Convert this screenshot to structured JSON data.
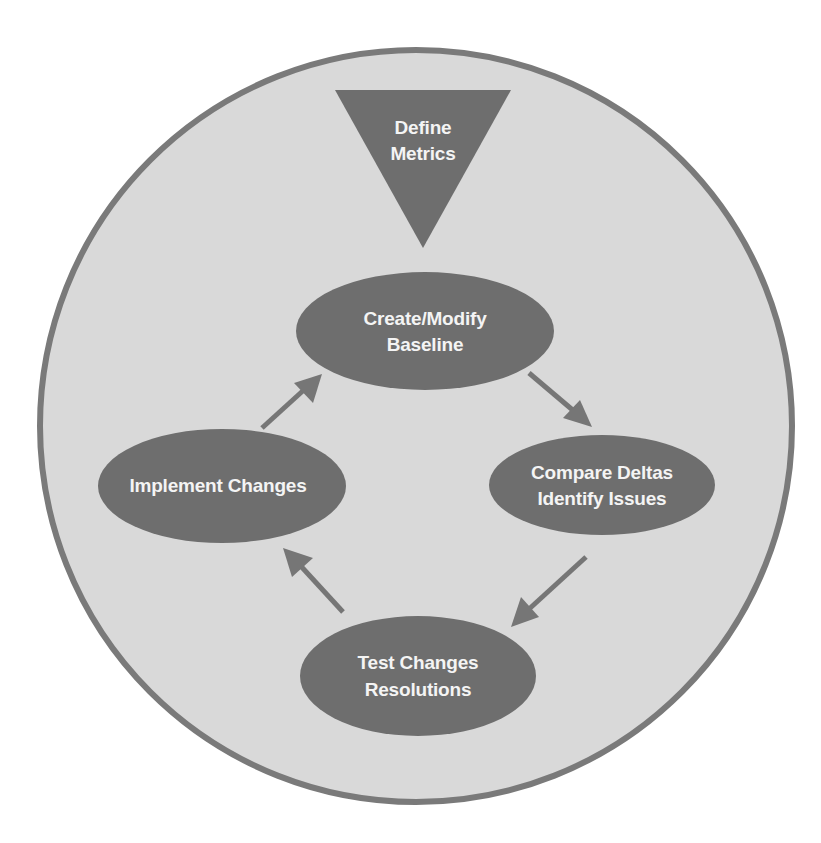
{
  "diagram": {
    "type": "cycle",
    "colors": {
      "background": "#ffffff",
      "circle_fill": "#d9d9d9",
      "circle_stroke": "#7a7a7a",
      "node_fill": "#6e6e6e",
      "node_text": "#f4f4f4",
      "arrow": "#767676"
    },
    "entry": {
      "shape": "inverted-triangle",
      "lines": [
        "Define",
        "Metrics"
      ]
    },
    "nodes": [
      {
        "id": "create-modify-baseline",
        "lines": [
          "Create/Modify",
          "Baseline"
        ]
      },
      {
        "id": "compare-deltas",
        "lines": [
          "Compare Deltas",
          "Identify Issues"
        ]
      },
      {
        "id": "test-changes",
        "lines": [
          "Test Changes",
          "Resolutions"
        ]
      },
      {
        "id": "implement-changes",
        "lines": [
          "Implement Changes"
        ]
      }
    ],
    "edges": [
      {
        "from": "create-modify-baseline",
        "to": "compare-deltas"
      },
      {
        "from": "compare-deltas",
        "to": "test-changes"
      },
      {
        "from": "test-changes",
        "to": "implement-changes"
      },
      {
        "from": "implement-changes",
        "to": "create-modify-baseline"
      }
    ]
  }
}
